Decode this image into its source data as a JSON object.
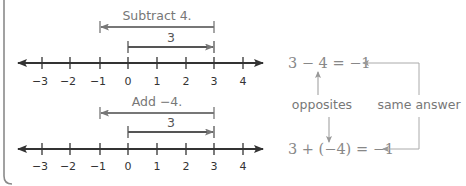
{
  "colors": {
    "axis": "#333333",
    "arrow_gray": "#777777",
    "label_gray": "#777777",
    "equation_gray": "#888888",
    "connector_gray": "#aaaaaa",
    "frame": "#777777"
  },
  "number_lines": [
    {
      "id": "top",
      "operation_label": "Subtract 4.",
      "operation_arrow": {
        "from": 3,
        "to": -1
      },
      "start_label": "3",
      "start_arrow": {
        "from": 0,
        "to": 3
      },
      "ticks": [
        "−3",
        "−2",
        "−1",
        "0",
        "1",
        "2",
        "3",
        "4"
      ]
    },
    {
      "id": "bottom",
      "operation_label": "Add −4.",
      "operation_arrow": {
        "from": 3,
        "to": -1
      },
      "start_label": "3",
      "start_arrow": {
        "from": 0,
        "to": 3
      },
      "ticks": [
        "−3",
        "−2",
        "−1",
        "0",
        "1",
        "2",
        "3",
        "4"
      ]
    }
  ],
  "equations": {
    "subtraction": "3 − 4 = −1",
    "addition": "3 + (−4) = −1"
  },
  "annotations": {
    "opposites": "opposites",
    "same_answer": "same answer"
  }
}
